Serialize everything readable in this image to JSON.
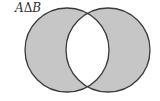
{
  "diagram": {
    "type": "venn",
    "title": "AΔB",
    "label_parts": {
      "left": "A",
      "operator": "Δ",
      "right": "B"
    },
    "sets": [
      "A",
      "B"
    ],
    "shaded_regions": [
      "A only",
      "B only"
    ],
    "unshaded_regions": [
      "A ∩ B"
    ],
    "colors": {
      "fill": "#c6c6c6",
      "stroke": "#3a3a3a",
      "background": "#ffffff"
    }
  }
}
